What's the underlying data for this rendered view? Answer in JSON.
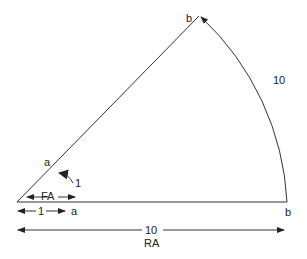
{
  "diagram": {
    "labels": {
      "b_top": "b",
      "b_right": "b",
      "a_upper": "a",
      "a_lower": "a",
      "arc_length": "10",
      "angle": "1",
      "fa": "FA",
      "unit_length": "1",
      "radius_length": "10",
      "ra": "RA"
    },
    "colors": {
      "line": "#333333",
      "text": "#222222",
      "background": "#ffffff"
    }
  }
}
